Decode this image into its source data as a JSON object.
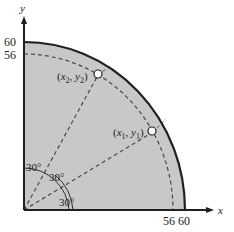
{
  "figure": {
    "type": "quarter-circle region diagram",
    "fill_color": "#c8c8c8",
    "stroke_color": "#231f20",
    "axes": {
      "x_label": "x",
      "y_label": "y",
      "x_ticks": [
        "56",
        "60"
      ],
      "y_ticks": [
        "60",
        "56"
      ]
    },
    "outer_radius": 60,
    "dashed_radius": 56,
    "points": [
      {
        "label_x": "x",
        "label_sub": "1",
        "label_y": "y",
        "label_ysub": "1",
        "angle_deg": 30
      },
      {
        "label_x": "x",
        "label_sub": "2",
        "label_y": "y",
        "label_ysub": "2",
        "angle_deg": 60
      }
    ],
    "angle_labels": [
      "30°",
      "30°",
      "30°"
    ]
  }
}
